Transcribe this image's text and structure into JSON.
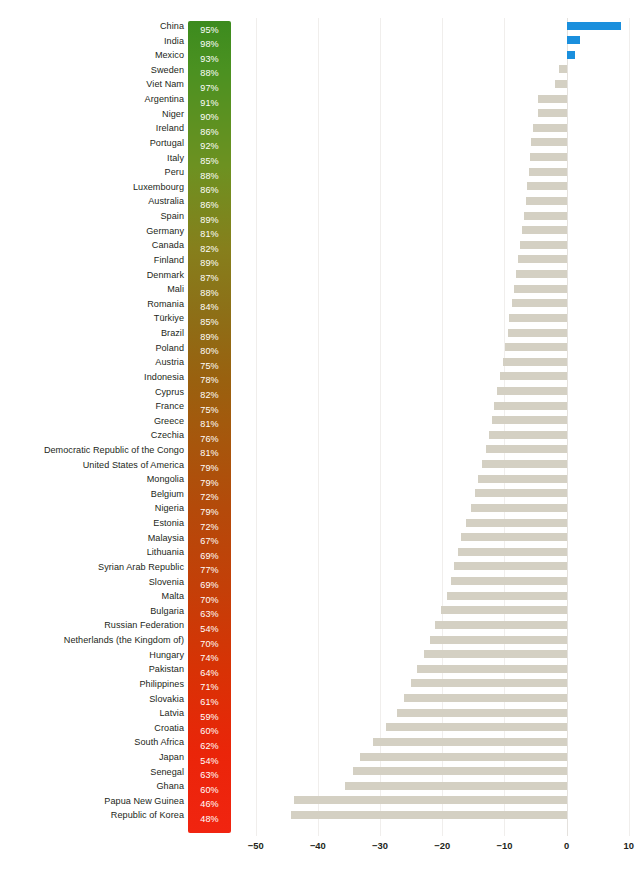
{
  "chart_data": {
    "type": "bar",
    "orientation": "horizontal",
    "title": "",
    "subtitle": "",
    "xlabel": "",
    "ylabel": "",
    "xlim": [
      -53,
      11
    ],
    "xticks": [
      -50,
      -40,
      -30,
      -20,
      -10,
      0,
      10
    ],
    "xtick_labels": [
      "−50",
      "−40",
      "−30",
      "−20",
      "−10",
      "0",
      "10"
    ],
    "grid": "vertical",
    "legend": "none",
    "colors": {
      "negative_bar": "#d4d0c3",
      "positive_bar": "#1a8fdd",
      "gradient_top": "#3c8b1e",
      "gradient_mid": "#a7560c",
      "gradient_bottom": "#f12410",
      "gridline": "#f0eeec",
      "text": "#231f20",
      "swatch_text": "#ffffff"
    },
    "categories": [
      "China",
      "India",
      "Mexico",
      "Sweden",
      "Viet Nam",
      "Argentina",
      "Niger",
      "Ireland",
      "Portugal",
      "Italy",
      "Peru",
      "Luxembourg",
      "Australia",
      "Spain",
      "Germany",
      "Canada",
      "Finland",
      "Denmark",
      "Mali",
      "Romania",
      "Türkiye",
      "Brazil",
      "Poland",
      "Austria",
      "Indonesia",
      "Cyprus",
      "France",
      "Greece",
      "Czechia",
      "Democratic Republic of the Congo",
      "United States of America",
      "Mongolia",
      "Belgium",
      "Nigeria",
      "Estonia",
      "Malaysia",
      "Lithuania",
      "Syrian Arab Republic",
      "Slovenia",
      "Malta",
      "Bulgaria",
      "Russian Federation",
      "Netherlands (the Kingdom of)",
      "Hungary",
      "Pakistan",
      "Philippines",
      "Slovakia",
      "Latvia",
      "Croatia",
      "South Africa",
      "Japan",
      "Senegal",
      "Ghana",
      "Papua New Guinea",
      "Republic of Korea"
    ],
    "percent_labels": [
      "95%",
      "98%",
      "93%",
      "88%",
      "97%",
      "91%",
      "90%",
      "86%",
      "92%",
      "85%",
      "88%",
      "86%",
      "86%",
      "89%",
      "81%",
      "82%",
      "89%",
      "87%",
      "88%",
      "84%",
      "85%",
      "89%",
      "80%",
      "75%",
      "78%",
      "82%",
      "75%",
      "81%",
      "76%",
      "81%",
      "79%",
      "79%",
      "72%",
      "79%",
      "72%",
      "67%",
      "69%",
      "77%",
      "69%",
      "70%",
      "63%",
      "54%",
      "70%",
      "74%",
      "64%",
      "71%",
      "61%",
      "59%",
      "60%",
      "62%",
      "54%",
      "63%",
      "60%",
      "46%",
      "48%"
    ],
    "percent_values": [
      95,
      98,
      93,
      88,
      97,
      91,
      90,
      86,
      92,
      85,
      88,
      86,
      86,
      89,
      81,
      82,
      89,
      87,
      88,
      84,
      85,
      89,
      80,
      75,
      78,
      82,
      75,
      81,
      76,
      81,
      79,
      79,
      72,
      79,
      72,
      67,
      69,
      77,
      69,
      70,
      63,
      54,
      70,
      74,
      64,
      71,
      61,
      59,
      60,
      62,
      54,
      63,
      60,
      46,
      48
    ],
    "values": [
      8.7,
      2.1,
      1.4,
      -1.3,
      -1.9,
      -4.6,
      -4.6,
      -5.4,
      -5.7,
      -5.9,
      -6.1,
      -6.3,
      -6.6,
      -6.8,
      -7.2,
      -7.5,
      -7.8,
      -8.1,
      -8.4,
      -8.8,
      -9.2,
      -9.5,
      -9.9,
      -10.3,
      -10.7,
      -11.2,
      -11.6,
      -12.0,
      -12.5,
      -13.0,
      -13.6,
      -14.2,
      -14.8,
      -15.4,
      -16.1,
      -16.9,
      -17.5,
      -18.1,
      -18.6,
      -19.3,
      -20.2,
      -21.1,
      -22.0,
      -23.0,
      -24.0,
      -25.0,
      -26.1,
      -27.3,
      -29.1,
      -31.2,
      -33.3,
      -34.4,
      -35.6,
      -43.8,
      -44.3
    ]
  }
}
